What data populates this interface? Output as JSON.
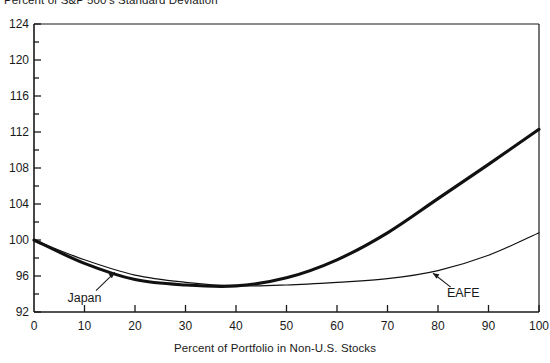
{
  "chart_data": {
    "type": "line",
    "title": "Percent of S&P 500's Standard Deviation",
    "xlabel": "Percent of Portfolio in Non-U.S. Stocks",
    "ylabel": "",
    "xlim": [
      0,
      100
    ],
    "ylim": [
      92,
      124
    ],
    "xticks": [
      0,
      10,
      20,
      30,
      40,
      50,
      60,
      70,
      80,
      90,
      100
    ],
    "yticks": [
      92,
      96,
      100,
      104,
      108,
      112,
      116,
      120,
      124
    ],
    "y_minor_tick_step": 2,
    "grid": false,
    "legend": "inline-annotations",
    "x": [
      0,
      10,
      20,
      30,
      40,
      50,
      60,
      70,
      80,
      90,
      100
    ],
    "series": [
      {
        "name": "Japan",
        "style": "thick",
        "color": "#111111",
        "values": [
          100.0,
          97.4,
          95.6,
          95.0,
          94.9,
          95.8,
          97.8,
          100.8,
          104.6,
          108.4,
          112.3
        ]
      },
      {
        "name": "EAFE",
        "style": "thin",
        "color": "#111111",
        "values": [
          100.0,
          97.8,
          96.1,
          95.3,
          94.9,
          95.0,
          95.3,
          95.7,
          96.6,
          98.3,
          100.8
        ]
      }
    ],
    "annotations": [
      {
        "text": "Japan",
        "series": "Japan",
        "label_x": 10,
        "label_y": 93.6,
        "arrow_to_x": 16,
        "arrow_to_y": 96.4
      },
      {
        "text": "EAFE",
        "series": "EAFE",
        "label_x": 85,
        "label_y": 94.1,
        "arrow_to_x": 79,
        "arrow_to_y": 96.3
      }
    ]
  },
  "tick_labels": {
    "y": [
      "124",
      "120",
      "116",
      "112",
      "108",
      "104",
      "100",
      "96",
      "92"
    ],
    "x": [
      "0",
      "10",
      "20",
      "30",
      "40",
      "50",
      "60",
      "70",
      "80",
      "90",
      "100"
    ]
  }
}
